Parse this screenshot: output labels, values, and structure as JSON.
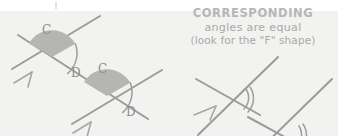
{
  "page": {
    "background_color": "#f2f2f0",
    "ink_color": "#9b9b99",
    "wedge_color": "#b5b5b3",
    "text_color": "#b0b0ae"
  },
  "caption": {
    "heading": "CORRESPONDING",
    "line2": "angles are equal",
    "line3": "(look for the \"F\" shape)"
  },
  "left_figure": {
    "name": "corresponding-angles-labeled-diagram",
    "intersections": [
      {
        "id": "upper",
        "filled_angle_label": "C",
        "arc_angle_label": "D"
      },
      {
        "id": "lower",
        "filled_angle_label": "C",
        "arc_angle_label": "D"
      }
    ],
    "parallel_marks": "single-chevron-arrowhead",
    "parallel_mark_count": 2
  },
  "right_figure": {
    "name": "corresponding-angles-arc-diagram",
    "angle_marks": "double-arc",
    "angle_mark_count": 2,
    "parallel_marks": "single-chevron-arrowhead",
    "parallel_mark_count": 1
  }
}
